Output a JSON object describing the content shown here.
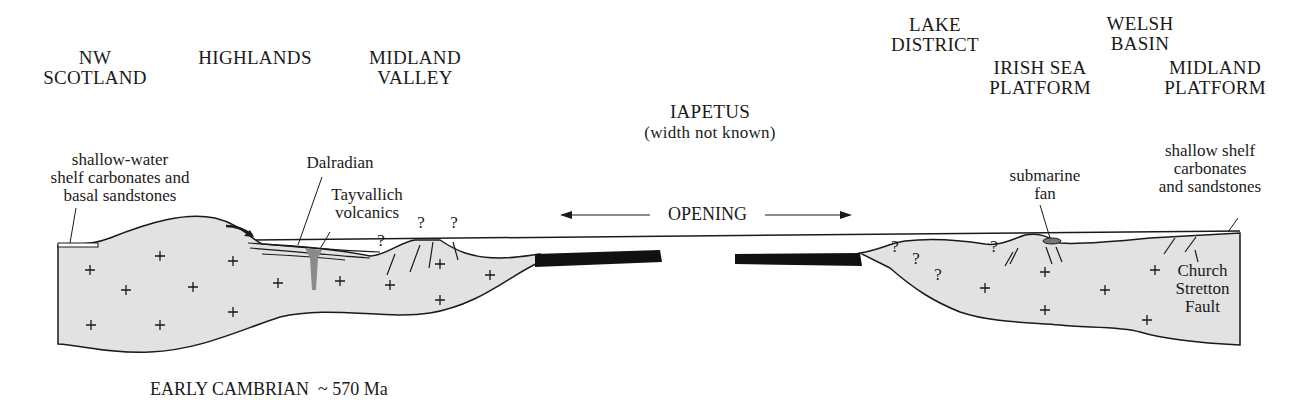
{
  "regions": {
    "nw_scotland": "NW\nSCOTLAND",
    "highlands": "HIGHLANDS",
    "midland_valley": "MIDLAND\nVALLEY",
    "iapetus": "IAPETUS",
    "iapetus_note": "(width not known)",
    "lake_district": "LAKE\nDISTRICT",
    "welsh_basin": "WELSH\nBASIN",
    "irish_sea_platform": "IRISH SEA\nPLATFORM",
    "midland_platform": "MIDLAND\nPLATFORM"
  },
  "annotations": {
    "shelf_left": "shallow-water\nshelf carbonates and\nbasal sandstones",
    "dalradian": "Dalradian",
    "tayvallich": "Tayvallich\nvolcanics",
    "opening": "OPENING",
    "submarine_fan": "submarine\nfan",
    "shelf_right": "shallow shelf\ncarbonates\nand sandstones",
    "church_stretton": "Church\nStretton\nFault",
    "uncertain_marker": "?"
  },
  "caption": "EARLY CAMBRIAN  ~ 570 Ma",
  "colors": {
    "crust_fill": "#e2e2e2",
    "oceanic_crust": "#111111",
    "volcanics": "#8a8a8a",
    "line": "#1a1a1a"
  }
}
